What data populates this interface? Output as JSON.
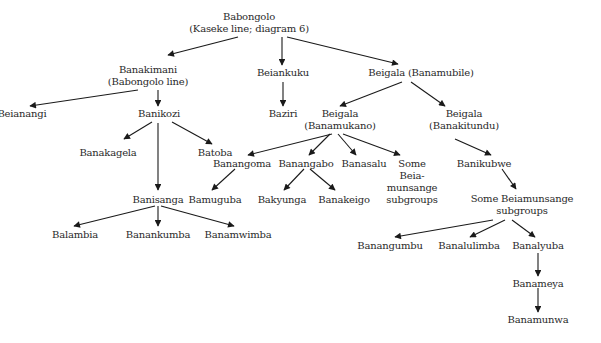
{
  "diagram": {
    "type": "genealogy-tree",
    "nodes": [
      {
        "id": "babongolo",
        "lines": [
          "Babongolo",
          "(Kaseke line; diagram 6)"
        ],
        "x": 249,
        "y": 11
      },
      {
        "id": "banakimani",
        "lines": [
          "Banakimani",
          "(Babongolo line)"
        ],
        "x": 148,
        "y": 64
      },
      {
        "id": "beiankuku",
        "lines": [
          "Beiankuku"
        ],
        "x": 283,
        "y": 67
      },
      {
        "id": "beigala_banamubile",
        "lines": [
          "Beigala (Banamubile)"
        ],
        "x": 421,
        "y": 67
      },
      {
        "id": "beianangi",
        "lines": [
          "Beianangi"
        ],
        "x": 22,
        "y": 108
      },
      {
        "id": "banikozi",
        "lines": [
          "Banikozi"
        ],
        "x": 159,
        "y": 108
      },
      {
        "id": "baziri",
        "lines": [
          "Baziri"
        ],
        "x": 283,
        "y": 108
      },
      {
        "id": "beigala_banamukano",
        "lines": [
          "Beigala",
          "(Banamukano)"
        ],
        "x": 340,
        "y": 108
      },
      {
        "id": "beigala_banakitundu",
        "lines": [
          "Beigala",
          "(Banakitundu)"
        ],
        "x": 464,
        "y": 108
      },
      {
        "id": "banakagela",
        "lines": [
          "Banakagela"
        ],
        "x": 108,
        "y": 147
      },
      {
        "id": "batoba",
        "lines": [
          "Batoba"
        ],
        "x": 215,
        "y": 147
      },
      {
        "id": "banangoma",
        "lines": [
          "Banangoma"
        ],
        "x": 242,
        "y": 158
      },
      {
        "id": "banangabo",
        "lines": [
          "Banangabo"
        ],
        "x": 306,
        "y": 158
      },
      {
        "id": "banasalu",
        "lines": [
          "Banasalu"
        ],
        "x": 364,
        "y": 158
      },
      {
        "id": "some_beia_munsange_1",
        "lines": [
          "Some",
          "Beia-",
          "munsange",
          "subgroups"
        ],
        "x": 412,
        "y": 158
      },
      {
        "id": "banikubwe",
        "lines": [
          "Banikubwe"
        ],
        "x": 484,
        "y": 158
      },
      {
        "id": "banisanga",
        "lines": [
          "Banisanga"
        ],
        "x": 158,
        "y": 194
      },
      {
        "id": "bamuguba",
        "lines": [
          "Bamuguba"
        ],
        "x": 215,
        "y": 194
      },
      {
        "id": "bakyunga",
        "lines": [
          "Bakyunga"
        ],
        "x": 282,
        "y": 194
      },
      {
        "id": "banakeigo",
        "lines": [
          "Banakeigo"
        ],
        "x": 344,
        "y": 194
      },
      {
        "id": "some_beiamunsange_2",
        "lines": [
          "Some Beiamunsange",
          "subgroups"
        ],
        "x": 522,
        "y": 193
      },
      {
        "id": "balambia",
        "lines": [
          "Balambia"
        ],
        "x": 75,
        "y": 229
      },
      {
        "id": "banankumba",
        "lines": [
          "Banankumba"
        ],
        "x": 158,
        "y": 229
      },
      {
        "id": "banamwimba",
        "lines": [
          "Banamwimba"
        ],
        "x": 238,
        "y": 229
      },
      {
        "id": "banangumbu",
        "lines": [
          "Banangumbu"
        ],
        "x": 390,
        "y": 240
      },
      {
        "id": "banalulimba",
        "lines": [
          "Banalulimba"
        ],
        "x": 469,
        "y": 240
      },
      {
        "id": "banalyuba",
        "lines": [
          "Banalyuba"
        ],
        "x": 538,
        "y": 240
      },
      {
        "id": "banameya",
        "lines": [
          "Banameya"
        ],
        "x": 538,
        "y": 278
      },
      {
        "id": "banamunwa",
        "lines": [
          "Banamunwa"
        ],
        "x": 538,
        "y": 314
      }
    ],
    "edges": [
      {
        "from": "babongolo",
        "to": "banakimani",
        "x1": 238,
        "y1": 37,
        "x2": 168,
        "y2": 55
      },
      {
        "from": "babongolo",
        "to": "beiankuku",
        "x1": 282,
        "y1": 37,
        "x2": 282,
        "y2": 65
      },
      {
        "from": "babongolo",
        "to": "beigala_banamubile",
        "x1": 287,
        "y1": 37,
        "x2": 398,
        "y2": 64
      },
      {
        "from": "banakimani",
        "to": "beianangi",
        "x1": 138,
        "y1": 90,
        "x2": 30,
        "y2": 106
      },
      {
        "from": "banakimani",
        "to": "banikozi",
        "x1": 158,
        "y1": 90,
        "x2": 158,
        "y2": 106
      },
      {
        "from": "beiankuku",
        "to": "baziri",
        "x1": 283,
        "y1": 82,
        "x2": 283,
        "y2": 106
      },
      {
        "from": "beigala_banamubile",
        "to": "beigala_banamukano",
        "x1": 402,
        "y1": 82,
        "x2": 340,
        "y2": 106
      },
      {
        "from": "beigala_banamubile",
        "to": "beigala_banakitundu",
        "x1": 411,
        "y1": 82,
        "x2": 445,
        "y2": 106
      },
      {
        "from": "banikozi",
        "to": "banakagela",
        "x1": 152,
        "y1": 122,
        "x2": 124,
        "y2": 139
      },
      {
        "from": "banikozi",
        "to": "batoba",
        "x1": 172,
        "y1": 122,
        "x2": 212,
        "y2": 144
      },
      {
        "from": "banikozi",
        "to": "banisanga",
        "x1": 158,
        "y1": 123,
        "x2": 158,
        "y2": 190
      },
      {
        "from": "beigala_banamukano",
        "to": "banangoma",
        "x1": 332,
        "y1": 134,
        "x2": 248,
        "y2": 155
      },
      {
        "from": "beigala_banamukano",
        "to": "banangabo",
        "x1": 330,
        "y1": 134,
        "x2": 309,
        "y2": 155
      },
      {
        "from": "beigala_banamukano",
        "to": "banasalu",
        "x1": 338,
        "y1": 134,
        "x2": 356,
        "y2": 155
      },
      {
        "from": "beigala_banamukano",
        "to": "some_beia_munsange_1",
        "x1": 343,
        "y1": 134,
        "x2": 400,
        "y2": 155
      },
      {
        "from": "beigala_banakitundu",
        "to": "banikubwe",
        "x1": 455,
        "y1": 139,
        "x2": 491,
        "y2": 155
      },
      {
        "from": "banangoma",
        "to": "bamuguba",
        "x1": 235,
        "y1": 169,
        "x2": 212,
        "y2": 190
      },
      {
        "from": "banangabo",
        "to": "bakyunga",
        "x1": 304,
        "y1": 169,
        "x2": 284,
        "y2": 190
      },
      {
        "from": "banangabo",
        "to": "banakeigo",
        "x1": 310,
        "y1": 169,
        "x2": 335,
        "y2": 190
      },
      {
        "from": "banikubwe",
        "to": "some_beiamunsange_2",
        "x1": 502,
        "y1": 169,
        "x2": 516,
        "y2": 189
      },
      {
        "from": "banisanga",
        "to": "balambia",
        "x1": 155,
        "y1": 206,
        "x2": 74,
        "y2": 226
      },
      {
        "from": "banisanga",
        "to": "banankumba",
        "x1": 158,
        "y1": 206,
        "x2": 158,
        "y2": 226
      },
      {
        "from": "banisanga",
        "to": "banamwimba",
        "x1": 161,
        "y1": 206,
        "x2": 234,
        "y2": 226
      },
      {
        "from": "some_beiamunsange_2",
        "to": "banangumbu",
        "x1": 493,
        "y1": 220,
        "x2": 395,
        "y2": 237
      },
      {
        "from": "some_beiamunsange_2",
        "to": "banalulimba",
        "x1": 505,
        "y1": 220,
        "x2": 470,
        "y2": 237
      },
      {
        "from": "some_beiamunsange_2",
        "to": "banalyuba",
        "x1": 512,
        "y1": 220,
        "x2": 535,
        "y2": 237
      },
      {
        "from": "banalyuba",
        "to": "banameya",
        "x1": 538,
        "y1": 253,
        "x2": 538,
        "y2": 276
      },
      {
        "from": "banameya",
        "to": "banamunwa",
        "x1": 538,
        "y1": 288,
        "x2": 538,
        "y2": 312
      }
    ]
  },
  "colors": {
    "background": "#ffffff",
    "text": "#2a2a2a",
    "line": "#1a1a1a"
  }
}
